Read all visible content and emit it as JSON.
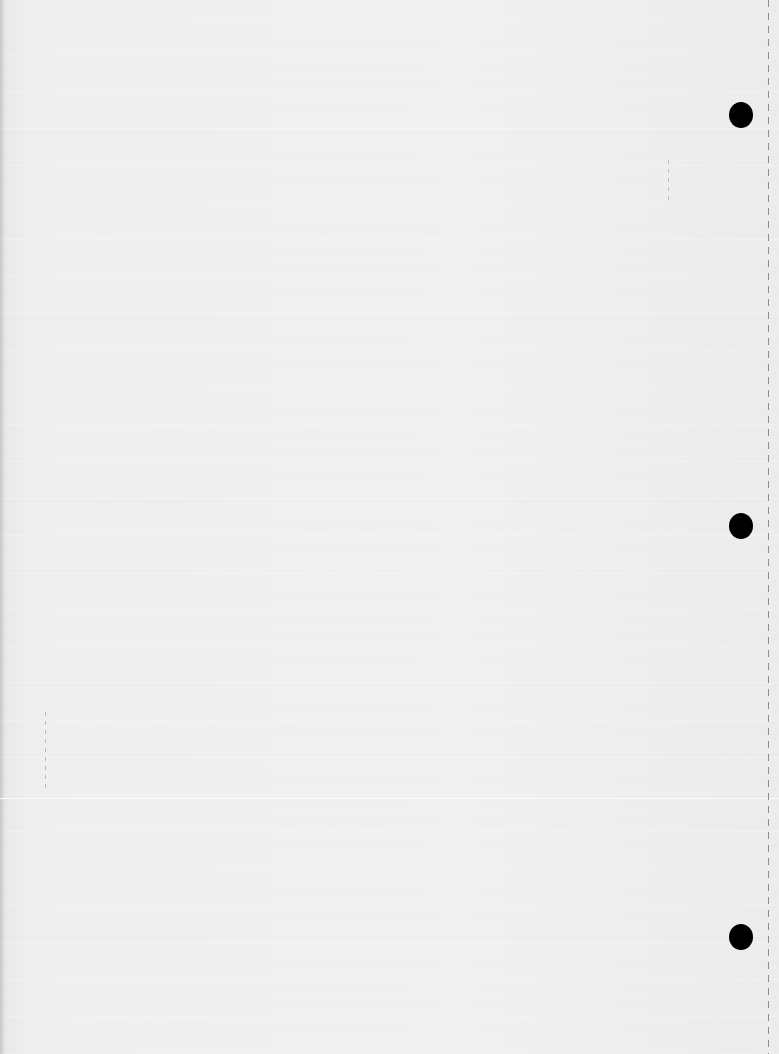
{
  "document": {
    "type": "scanned blank page",
    "text_content": "",
    "background_color": "#efefef",
    "punch_holes": [
      {
        "x": 741,
        "y": 115
      },
      {
        "x": 741,
        "y": 526
      },
      {
        "x": 741,
        "y": 937
      }
    ],
    "hole_color": "#000000",
    "perforation_x": 768
  }
}
